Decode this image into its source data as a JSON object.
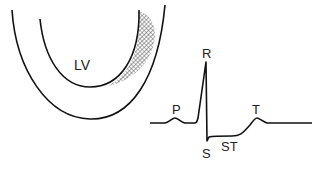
{
  "diagram": {
    "heart": {
      "chamber_label": "LV",
      "hatched_region": "ischemic-zone"
    },
    "ecg": {
      "wave_labels": {
        "p": "P",
        "r": "R",
        "s": "S",
        "st": "ST",
        "t": "T"
      }
    },
    "colors": {
      "line": "#111111",
      "hatch": "#444444",
      "background": "#ffffff"
    }
  }
}
